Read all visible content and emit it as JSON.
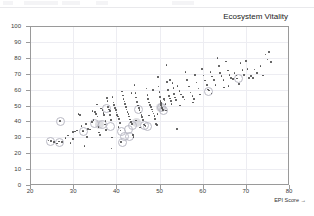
{
  "window": {
    "toolbar_visible": true,
    "background_color": "#ffffff"
  },
  "chart_data": {
    "type": "scatter",
    "title": "Ecosystem Vitality",
    "xlabel": "EPI Score →",
    "ylabel": "",
    "xlim": [
      20,
      80
    ],
    "ylim": [
      0,
      100
    ],
    "xticks": [
      20,
      30,
      40,
      50,
      60,
      70,
      80
    ],
    "yticks": [
      0,
      10,
      20,
      30,
      40,
      50,
      60,
      70,
      80,
      90,
      100
    ],
    "grid": true,
    "legend": "none",
    "marker_color": "#4a4a4a",
    "highlight_ring_color": "#b9b9c4",
    "points": [
      [
        24.3,
        28.0
      ],
      [
        24.9,
        27.6
      ],
      [
        25.6,
        27.2
      ],
      [
        26.2,
        26.0
      ],
      [
        26.9,
        40.4
      ],
      [
        26.7,
        27.4
      ],
      [
        27.4,
        27.0
      ],
      [
        28.2,
        29.6
      ],
      [
        28.8,
        31.2
      ],
      [
        29.4,
        26.3
      ],
      [
        29.9,
        33.2
      ],
      [
        30.4,
        33.6
      ],
      [
        30.9,
        34.2
      ],
      [
        31.2,
        44.8
      ],
      [
        31.6,
        44.0
      ],
      [
        31.9,
        37.2
      ],
      [
        32.2,
        34.0
      ],
      [
        32.4,
        33.8
      ],
      [
        32.6,
        24.5
      ],
      [
        33.0,
        38.4
      ],
      [
        33.4,
        35.2
      ],
      [
        33.9,
        35.0
      ],
      [
        34.3,
        39.6
      ],
      [
        34.7,
        41.0
      ],
      [
        35.0,
        46.0
      ],
      [
        35.3,
        44.6
      ],
      [
        35.6,
        43.2
      ],
      [
        35.9,
        36.5
      ],
      [
        36.2,
        31.6
      ],
      [
        36.5,
        48.2
      ],
      [
        36.8,
        47.0
      ],
      [
        37.0,
        45.4
      ],
      [
        37.2,
        44.0
      ],
      [
        37.4,
        38.0
      ],
      [
        37.6,
        34.6
      ],
      [
        37.8,
        54.8
      ],
      [
        38.0,
        53.0
      ],
      [
        38.1,
        49.2
      ],
      [
        38.3,
        47.6
      ],
      [
        38.5,
        46.4
      ],
      [
        38.6,
        44.2
      ],
      [
        38.8,
        41.0
      ],
      [
        38.9,
        23.0
      ],
      [
        39.1,
        55.4
      ],
      [
        39.3,
        52.0
      ],
      [
        39.5,
        50.2
      ],
      [
        39.7,
        48.6
      ],
      [
        39.9,
        47.0
      ],
      [
        40.0,
        45.6
      ],
      [
        40.2,
        44.2
      ],
      [
        40.4,
        43.0
      ],
      [
        40.6,
        41.5
      ],
      [
        40.8,
        39.0
      ],
      [
        41.0,
        34.4
      ],
      [
        41.1,
        27.0
      ],
      [
        41.3,
        58.8
      ],
      [
        41.5,
        56.2
      ],
      [
        41.7,
        54.0
      ],
      [
        41.9,
        52.6
      ],
      [
        42.0,
        50.8
      ],
      [
        42.2,
        49.0
      ],
      [
        42.4,
        47.4
      ],
      [
        42.6,
        46.0
      ],
      [
        42.8,
        44.6
      ],
      [
        43.0,
        43.0
      ],
      [
        43.2,
        41.2
      ],
      [
        43.4,
        39.6
      ],
      [
        43.6,
        38.2
      ],
      [
        43.8,
        31.4
      ],
      [
        44.0,
        30.2
      ],
      [
        44.2,
        63.0
      ],
      [
        44.4,
        58.0
      ],
      [
        44.6,
        55.0
      ],
      [
        44.8,
        52.2
      ],
      [
        45.0,
        50.0
      ],
      [
        45.2,
        48.4
      ],
      [
        45.4,
        47.0
      ],
      [
        45.6,
        45.6
      ],
      [
        45.8,
        44.0
      ],
      [
        46.0,
        42.6
      ],
      [
        46.2,
        41.0
      ],
      [
        46.4,
        38.0
      ],
      [
        46.6,
        37.4
      ],
      [
        46.8,
        36.8
      ],
      [
        47.0,
        60.6
      ],
      [
        47.2,
        56.6
      ],
      [
        47.4,
        54.2
      ],
      [
        47.6,
        52.0
      ],
      [
        47.8,
        50.4
      ],
      [
        48.0,
        49.0
      ],
      [
        48.2,
        47.6
      ],
      [
        48.4,
        46.2
      ],
      [
        48.6,
        45.0
      ],
      [
        48.8,
        43.4
      ],
      [
        49.0,
        41.6
      ],
      [
        49.2,
        38.2
      ],
      [
        49.4,
        37.6
      ],
      [
        49.6,
        67.8
      ],
      [
        49.8,
        62.0
      ],
      [
        50.0,
        58.6
      ],
      [
        50.1,
        55.4
      ],
      [
        50.2,
        53.0
      ],
      [
        50.3,
        51.4
      ],
      [
        50.4,
        50.2
      ],
      [
        50.5,
        49.4
      ],
      [
        50.6,
        48.6
      ],
      [
        50.7,
        47.8
      ],
      [
        50.8,
        47.0
      ],
      [
        51.0,
        54.0
      ],
      [
        51.2,
        53.2
      ],
      [
        51.4,
        51.0
      ],
      [
        51.6,
        75.6
      ],
      [
        51.8,
        64.6
      ],
      [
        52.0,
        59.6
      ],
      [
        52.2,
        56.0
      ],
      [
        52.4,
        54.4
      ],
      [
        52.6,
        52.8
      ],
      [
        52.8,
        51.0
      ],
      [
        53.0,
        64.2
      ],
      [
        53.2,
        61.0
      ],
      [
        53.4,
        57.4
      ],
      [
        53.6,
        55.0
      ],
      [
        53.8,
        53.6
      ],
      [
        54.0,
        35.4
      ],
      [
        54.2,
        62.4
      ],
      [
        54.6,
        59.0
      ],
      [
        55.0,
        57.0
      ],
      [
        55.4,
        55.2
      ],
      [
        55.8,
        53.8
      ],
      [
        56.0,
        71.2
      ],
      [
        56.4,
        66.2
      ],
      [
        56.8,
        62.0
      ],
      [
        57.2,
        58.2
      ],
      [
        57.6,
        56.0
      ],
      [
        57.8,
        51.8
      ],
      [
        58.2,
        69.0
      ],
      [
        58.6,
        64.4
      ],
      [
        59.0,
        60.6
      ],
      [
        59.4,
        57.0
      ],
      [
        59.8,
        73.0
      ],
      [
        60.2,
        68.8
      ],
      [
        60.6,
        65.6
      ],
      [
        61.0,
        63.0
      ],
      [
        61.2,
        60.0
      ],
      [
        61.4,
        59.4
      ],
      [
        61.8,
        71.0
      ],
      [
        62.2,
        68.2
      ],
      [
        62.6,
        66.0
      ],
      [
        63.0,
        62.8
      ],
      [
        63.4,
        80.0
      ],
      [
        63.8,
        74.8
      ],
      [
        64.0,
        70.6
      ],
      [
        64.4,
        68.4
      ],
      [
        64.8,
        66.2
      ],
      [
        65.0,
        61.2
      ],
      [
        65.4,
        77.8
      ],
      [
        65.8,
        72.0
      ],
      [
        66.2,
        69.0
      ],
      [
        66.6,
        67.4
      ],
      [
        67.0,
        66.8
      ],
      [
        67.4,
        70.6
      ],
      [
        67.8,
        68.8
      ],
      [
        68.0,
        67.0
      ],
      [
        68.4,
        63.6
      ],
      [
        68.8,
        76.8
      ],
      [
        69.2,
        72.4
      ],
      [
        69.6,
        69.2
      ],
      [
        70.0,
        78.0
      ],
      [
        70.4,
        73.0
      ],
      [
        70.8,
        67.2
      ],
      [
        71.2,
        68.6
      ],
      [
        72.0,
        72.6
      ],
      [
        72.6,
        70.4
      ],
      [
        73.4,
        75.0
      ],
      [
        74.0,
        68.8
      ],
      [
        74.6,
        82.0
      ],
      [
        75.0,
        79.0
      ],
      [
        75.4,
        83.6
      ],
      [
        75.8,
        77.2
      ],
      [
        71.6,
        67.4
      ],
      [
        66.0,
        62.4
      ],
      [
        62.0,
        57.6
      ],
      [
        58.0,
        54.2
      ],
      [
        54.8,
        50.0
      ],
      [
        51.5,
        46.8
      ],
      [
        47.5,
        43.8
      ],
      [
        44.5,
        40.6
      ],
      [
        40.5,
        36.4
      ],
      [
        36.0,
        33.0
      ],
      [
        33.2,
        30.2
      ],
      [
        30.0,
        28.8
      ],
      [
        35.5,
        50.6
      ],
      [
        43.5,
        57.8
      ],
      [
        48.5,
        59.8
      ],
      [
        52.5,
        66.0
      ],
      [
        45.5,
        36.2
      ],
      [
        49.5,
        44.6
      ],
      [
        39.0,
        30.0
      ],
      [
        34.5,
        46.6
      ],
      [
        37.5,
        40.2
      ]
    ],
    "highlighted_points": [
      [
        26.9,
        40.4
      ],
      [
        24.6,
        27.8
      ],
      [
        26.5,
        27.2
      ],
      [
        32.2,
        34.0
      ],
      [
        34.8,
        39.0
      ],
      [
        36.6,
        38.6
      ],
      [
        38.4,
        37.6
      ],
      [
        40.9,
        34.4
      ],
      [
        41.2,
        27.2
      ],
      [
        41.6,
        31.0
      ],
      [
        46.4,
        38.2
      ],
      [
        46.9,
        37.4
      ],
      [
        50.2,
        49.4
      ],
      [
        45.0,
        48.4
      ],
      [
        37.4,
        49.0
      ],
      [
        43.6,
        38.0
      ],
      [
        42.6,
        35.4
      ],
      [
        50.8,
        47.6
      ],
      [
        61.2,
        59.6
      ],
      [
        68.0,
        67.6
      ],
      [
        42.8,
        31.4
      ]
    ],
    "highlight_blobs": [
      [
        50.2,
        49.0
      ],
      [
        44.6,
        39.4
      ],
      [
        36.0,
        38.2
      ]
    ]
  }
}
